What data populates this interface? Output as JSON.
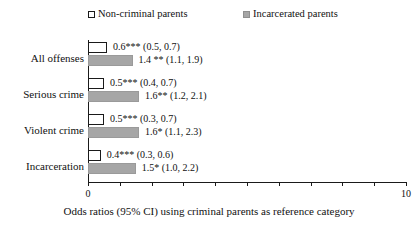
{
  "chart_data": {
    "type": "bar",
    "orientation": "horizontal",
    "title": "",
    "xlabel": "Odds ratios (95% CI) using criminal parents as reference category",
    "ylabel": "",
    "xlim": [
      0,
      10
    ],
    "xticks": [
      0,
      1,
      2,
      3,
      4,
      5,
      6,
      7,
      8,
      9,
      10
    ],
    "xtick_labels": [
      "0",
      "",
      "",
      "",
      "",
      "",
      "",
      "",
      "",
      "",
      "10"
    ],
    "grid": false,
    "legend_position": "top",
    "categories": [
      "All offenses",
      "Serious crime",
      "Violent crime",
      "Incarceration"
    ],
    "series": [
      {
        "name": "Non-criminal parents",
        "color": "#ffffff",
        "edge_color": "#1a1a1a",
        "values": [
          0.6,
          0.5,
          0.5,
          0.4
        ],
        "ci_low": [
          0.5,
          0.4,
          0.3,
          0.3
        ],
        "ci_high": [
          0.7,
          0.7,
          0.7,
          0.6
        ],
        "labels": [
          "0.6*** (0.5, 0.7)",
          "0.5*** (0.4, 0.7)",
          "0.5*** (0.3, 0.7)",
          "0.4*** (0.3, 0.6)"
        ]
      },
      {
        "name": "Incarcerated parents",
        "color": "#a6a6a6",
        "edge_color": "#9a9a9a",
        "values": [
          1.4,
          1.6,
          1.6,
          1.5
        ],
        "ci_low": [
          1.1,
          1.2,
          1.1,
          1.0
        ],
        "ci_high": [
          1.9,
          2.1,
          2.3,
          2.2
        ],
        "labels": [
          "1.4 ** (1.1, 1.9)",
          "1.6** (1.2, 2.1)",
          "1.6* (1.1, 2.3)",
          "1.5* (1.0, 2.2)"
        ]
      }
    ]
  },
  "legend": {
    "entries": [
      {
        "label": "Non-criminal parents",
        "marker": "open-square"
      },
      {
        "label": "Incarcerated parents",
        "marker": "filled-square"
      }
    ]
  },
  "axis": {
    "x_min_label": "0",
    "x_max_label": "10"
  },
  "caption": {
    "text": "Odds ratios (95% CI) using criminal parents as reference category"
  }
}
